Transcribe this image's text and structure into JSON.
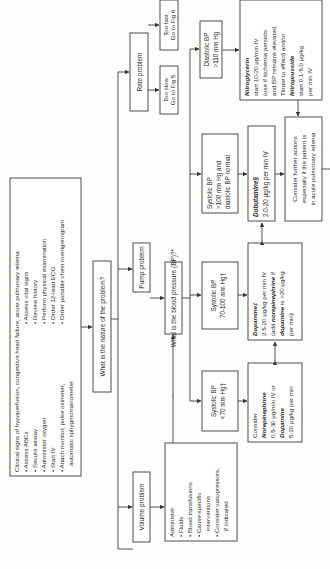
{
  "diagram": {
    "orientation": "rotated-90-ccw",
    "clinical_signs": {
      "title": "Clinical signs of hypoperfusion, congestive heart failure, acute pulmonary edema",
      "left_items": [
        "Assess ABCs",
        "Secure airway",
        "Administer oxygen",
        "Start IV",
        "Attach monitor, pulse oximeter,",
        "automatic sphygmomanometer"
      ],
      "right_items": [
        "Assess vital signs",
        "Review history",
        "Perform physical examination",
        "Order 12-lead ECG",
        "Order portable chest roentgenogram"
      ]
    },
    "nature_question": "What is the nature of the problem?",
    "volume_problem": "Volume problem",
    "pump_problem": "Pump problem",
    "rate_problem": "Rate problem",
    "administer": {
      "title": "Administer",
      "items": [
        "Fluids",
        "Blood transfusions",
        "Cause-specific",
        "interventions",
        "Consider vasopressors,",
        "if indicated"
      ]
    },
    "bp_question": "What is the blood pressure (BP)?*",
    "too_slow": [
      "Too slow",
      "Go to Fig 5"
    ],
    "too_fast": [
      "Too fast",
      "Go to Fig 6"
    ],
    "sbp_lt70": [
      "Systolic BP",
      "<70 mm Hg†"
    ],
    "sbp_70_100": [
      "Systolic BP",
      "70-100 mm Hg†"
    ],
    "sbp_gt100": [
      "Systolic BP",
      ">100 mm Hg and",
      "diastolic BP normal"
    ],
    "dbp_gt110": [
      "Diastolic BP",
      ">110 mm Hg"
    ],
    "norepi": {
      "line1": "Consider",
      "drug1": "Norepinephrine",
      "line3": "0.5-30 μg/min IV or",
      "drug2": "Dopamine",
      "line5": "5-20 μg/kg per min"
    },
    "dopamine": {
      "drug": "Dopamine‡",
      "line2": "2.5-20 μg/kg per min IV",
      "line3a": "(add ",
      "line3b": "norepinephrine",
      "line3c": " if",
      "line4a": "dopamine",
      "line4b": " is >20 μg/kg",
      "line5": "per min)"
    },
    "dobutamine": {
      "drug": "Dobutamine§",
      "line2": "2.0-20 μg/kg per min IV"
    },
    "nitro": {
      "drug1": "Nitroglycerin",
      "line2": "start 10-20 μg/min IV",
      "line3": "(use if ischemia persists",
      "line4": "and BP remains elevated.",
      "line5": "Titrate to effect) and/or",
      "drug2": "Nitroprusside",
      "line7": "start 0.1-5.0 μg/kg",
      "line8": "per min IV"
    },
    "further": [
      "Consider further actions",
      "especially if the patient is",
      "in acute pulmonary edema"
    ]
  }
}
